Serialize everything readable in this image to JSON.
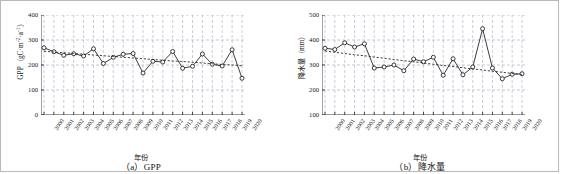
{
  "figure": {
    "panels": [
      {
        "id": "gpp",
        "caption": "（a）GPP",
        "xlabel": "年份",
        "ylabel_main": "GPP（gC·m",
        "ylabel_sup1": "-2",
        "ylabel_mid": "·a",
        "ylabel_sup2": "-1",
        "ylabel_end": "）"
      },
      {
        "id": "precipitation",
        "caption": "（b）降水量",
        "xlabel": "年份",
        "ylabel_main": "降水量（mm）"
      }
    ]
  },
  "chart_data": [
    {
      "type": "line",
      "id": "gpp",
      "title": "（a）GPP",
      "xlabel": "年份",
      "ylabel": "GPP（gC·m-2·a-1）",
      "ylim": [
        0,
        400
      ],
      "yticks": [
        0,
        100,
        200,
        300,
        400
      ],
      "grid": true,
      "legend": false,
      "x": [
        2000,
        2001,
        2002,
        2003,
        2004,
        2005,
        2006,
        2007,
        2008,
        2009,
        2010,
        2011,
        2012,
        2013,
        2014,
        2015,
        2016,
        2017,
        2018,
        2019,
        2020
      ],
      "categories": [
        "2000",
        "2001",
        "2002",
        "2003",
        "2004",
        "2005",
        "2006",
        "2007",
        "2008",
        "2009",
        "2010",
        "2011",
        "2012",
        "2013",
        "2014",
        "2015",
        "2016",
        "2017",
        "2018",
        "2019",
        "2020"
      ],
      "series": [
        {
          "name": "GPP",
          "style": "solid-line-open-circle-markers",
          "values": [
            269,
            253,
            239,
            245,
            236,
            265,
            206,
            231,
            243,
            246,
            168,
            215,
            212,
            254,
            187,
            195,
            244,
            203,
            196,
            261,
            147
          ]
        },
        {
          "name": "线性趋势",
          "style": "dotted-trend-line",
          "values": [
            255,
            252,
            249,
            246,
            243,
            240,
            237,
            234,
            231,
            228,
            225,
            222,
            219,
            216,
            214,
            211,
            208,
            205,
            202,
            200,
            197
          ]
        }
      ]
    },
    {
      "type": "line",
      "id": "precipitation",
      "title": "（b）降水量",
      "xlabel": "年份",
      "ylabel": "降水量（mm）",
      "ylim": [
        100,
        500
      ],
      "yticks": [
        100,
        200,
        300,
        400,
        500
      ],
      "grid": true,
      "legend": false,
      "x": [
        2000,
        2001,
        2002,
        2003,
        2004,
        2005,
        2006,
        2007,
        2008,
        2009,
        2010,
        2011,
        2012,
        2013,
        2014,
        2015,
        2016,
        2017,
        2018,
        2019,
        2020
      ],
      "categories": [
        "2000",
        "2001",
        "2002",
        "2003",
        "2004",
        "2005",
        "2006",
        "2007",
        "2008",
        "2009",
        "2010",
        "2011",
        "2012",
        "2013",
        "2014",
        "2015",
        "2016",
        "2017",
        "2018",
        "2019",
        "2020"
      ],
      "series": [
        {
          "name": "降水量",
          "style": "solid-line-open-circle-markers",
          "values": [
            367,
            362,
            389,
            372,
            385,
            288,
            292,
            300,
            277,
            324,
            313,
            331,
            259,
            325,
            261,
            292,
            445,
            288,
            245,
            263,
            265
          ]
        },
        {
          "name": "线性趋势",
          "style": "dotted-trend-line",
          "values": [
            356,
            351,
            346,
            341,
            337,
            332,
            327,
            322,
            317,
            313,
            308,
            303,
            298,
            294,
            289,
            284,
            280,
            275,
            271,
            266,
            262
          ]
        }
      ]
    }
  ]
}
